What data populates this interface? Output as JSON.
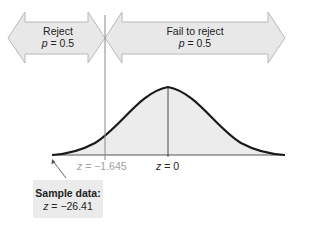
{
  "regions": {
    "reject": {
      "title": "Reject",
      "p_var": "p",
      "p_value": "= 0.5"
    },
    "fail_to_reject": {
      "title": "Fail to reject",
      "p_var": "p",
      "p_value": "= 0.5"
    }
  },
  "axis": {
    "critical": {
      "var": "z",
      "value": "= −1.645"
    },
    "center": {
      "var": "z",
      "value": "= 0"
    }
  },
  "sample": {
    "title": "Sample data:",
    "var": "z",
    "value": "= −26.41"
  },
  "colors": {
    "arrow_fill": "#e8e8e8",
    "arrow_stroke": "#b8b8b8",
    "curve": "#1a1a1a",
    "area_fill": "#ececec",
    "critical_line": "#888888",
    "muted_text": "#a0a0a0"
  }
}
